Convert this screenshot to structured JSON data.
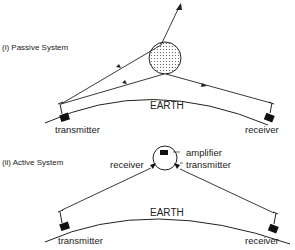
{
  "passive": {
    "title": "(i) Passive System",
    "earth": "EARTH",
    "transmitter": "transmitter",
    "receiver": "receiver",
    "satellite": "passive-reflector-sphere"
  },
  "active": {
    "title": "(ii) Active System",
    "earth": "EARTH",
    "transmitter": "transmitter",
    "receiver": "receiver",
    "sat_receiver": "receiver",
    "sat_amplifier": "amplifier",
    "sat_transmitter": "transmitter",
    "amp_symbol": "AS"
  },
  "colors": {
    "ink": "#222222",
    "dots": "#555555"
  }
}
